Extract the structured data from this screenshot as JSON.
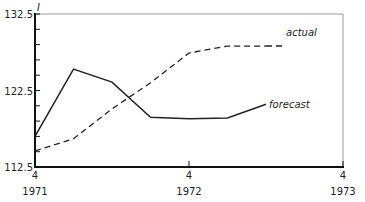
{
  "chart_data": {
    "type": "line",
    "title": "",
    "xlabel": "",
    "ylabel": "I",
    "ylim": [
      112.5,
      132.5
    ],
    "grid": false,
    "legend_position": "inline-labels",
    "x_ticks": [
      {
        "quarter": "4",
        "year": "1971"
      },
      {
        "quarter": "4",
        "year": "1972"
      },
      {
        "quarter": "4",
        "year": "1973"
      }
    ],
    "y_ticks": [
      "112.5",
      "122.5",
      "132.5"
    ],
    "y_minor_ticks_per_interval": 4,
    "x": [
      "1971 Q4",
      "1972 Q1",
      "1972 Q2",
      "1972 Q3",
      "1972 Q4",
      "1973 Q1",
      "1973 Q2"
    ],
    "series": [
      {
        "name": "actual",
        "style": "dashed",
        "values": [
          114.6,
          116.2,
          120.1,
          123.5,
          127.4,
          128.3,
          128.3
        ]
      },
      {
        "name": "forecast",
        "style": "solid",
        "values": [
          116.5,
          125.3,
          123.6,
          119.0,
          118.8,
          118.9,
          120.7
        ]
      }
    ]
  },
  "labels": {
    "y_axis_symbol": "I",
    "actual": "actual",
    "forecast": "forecast"
  }
}
